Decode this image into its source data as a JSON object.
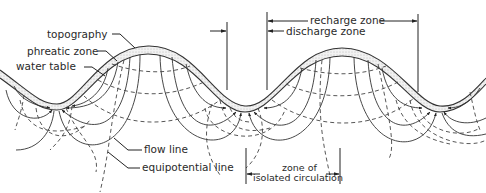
{
  "diagram": {
    "labels": {
      "topography": "topography",
      "phreatic_zone": "phreatic zone",
      "water_table": "water table",
      "flow_line": "flow line",
      "equipotential_line": "equipotential line",
      "recharge_zone": "recharge zone",
      "discharge_zone": "discharge zone",
      "isolated_circulation_line1": "zone of",
      "isolated_circulation_line2": "isolated circulation"
    },
    "colors": {
      "line": "#333333",
      "phreatic_fill": "#e6e6e6",
      "background": "#ffffff"
    }
  }
}
